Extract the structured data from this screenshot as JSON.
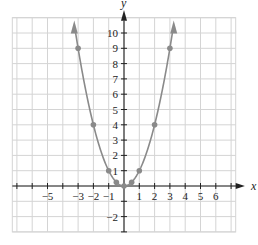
{
  "chart_data": {
    "type": "line",
    "title": "",
    "xlabel": "x",
    "ylabel": "y",
    "function": "y = x^2",
    "xlim": [
      -7,
      7
    ],
    "ylim": [
      -3,
      11
    ],
    "grid": true,
    "x_ticks": [
      -5,
      -3,
      -2,
      -1,
      1,
      2,
      3,
      4,
      5,
      6
    ],
    "y_ticks": [
      -2,
      1,
      2,
      3,
      4,
      5,
      6,
      7,
      8,
      9,
      10
    ],
    "points": [
      {
        "x": -3,
        "y": 9
      },
      {
        "x": -2,
        "y": 4
      },
      {
        "x": -1,
        "y": 1
      },
      {
        "x": -0.5,
        "y": 0.25
      },
      {
        "x": 0,
        "y": 0
      },
      {
        "x": 0.5,
        "y": 0.25
      },
      {
        "x": 1,
        "y": 1
      },
      {
        "x": 2,
        "y": 4
      },
      {
        "x": 3,
        "y": 9
      }
    ],
    "colors": {
      "curve": "#8a8a8a",
      "points": "#8a8a8a",
      "grid": "#d4d4d4",
      "axes": "#222222"
    }
  }
}
